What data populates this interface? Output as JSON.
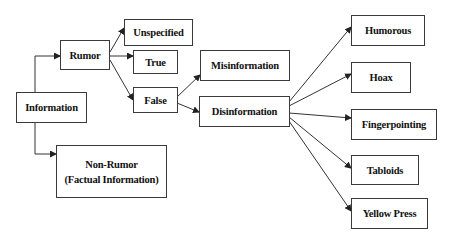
{
  "diagram": {
    "type": "taxonomy-tree",
    "nodes": {
      "information": "Information",
      "rumor": "Rumor",
      "non_rumor_line1": "Non-Rumor",
      "non_rumor_line2": "(Factual Information)",
      "unspecified": "Unspecified",
      "true": "True",
      "false": "False",
      "misinformation": "Misinformation",
      "disinformation": "Disinformation",
      "humorous": "Humorous",
      "hoax": "Hoax",
      "fingerpointing": "Fingerpointing",
      "tabloids": "Tabloids",
      "yellow_press": "Yellow Press"
    },
    "edges": [
      [
        "Information",
        "Rumor"
      ],
      [
        "Information",
        "Non-Rumor (Factual Information)"
      ],
      [
        "Rumor",
        "Unspecified"
      ],
      [
        "Rumor",
        "True"
      ],
      [
        "Rumor",
        "False"
      ],
      [
        "False",
        "Misinformation"
      ],
      [
        "False",
        "Disinformation"
      ],
      [
        "Disinformation",
        "Humorous"
      ],
      [
        "Disinformation",
        "Hoax"
      ],
      [
        "Disinformation",
        "Fingerpointing"
      ],
      [
        "Disinformation",
        "Tabloids"
      ],
      [
        "Disinformation",
        "Yellow Press"
      ]
    ]
  }
}
